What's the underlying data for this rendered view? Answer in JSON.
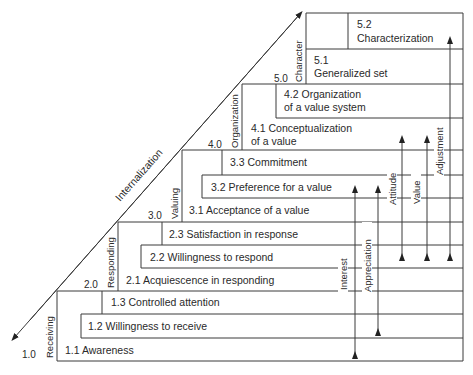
{
  "diagram": {
    "axis_label": "Internalization",
    "colors": {
      "line": "#3a3a3a",
      "text": "#2a2a2a",
      "background": "#ffffff"
    },
    "levels": [
      {
        "number": "1.0",
        "name": "Receiving",
        "items": [
          "1.1 Awareness",
          "1.2 Willingness to receive",
          "1.3 Controlled attention"
        ]
      },
      {
        "number": "2.0",
        "name": "Responding",
        "items": [
          "2.1 Acquiescence in responding",
          "2.2 Willingness to respond",
          "2.3 Satisfaction in response"
        ]
      },
      {
        "number": "3.0",
        "name": "Valuing",
        "items": [
          "3.1 Acceptance of a value",
          "3.2 Preference for a value",
          "3.3 Commitment"
        ]
      },
      {
        "number": "4.0",
        "name": "Organization",
        "items": [
          {
            "line1": "4.1 Conceptualization",
            "line2": "of a value"
          },
          {
            "line1": "4.2 Organization",
            "line2": "of a value system"
          }
        ]
      },
      {
        "number": "5.0",
        "name": "Character",
        "items": [
          {
            "line1": "5.1",
            "line2": "Generalized set"
          },
          {
            "line1": "5.2",
            "line2": "Characterization"
          }
        ]
      }
    ],
    "ranges": [
      {
        "label": "Interest",
        "from": "1.1",
        "to": "3.2"
      },
      {
        "label": "Appreciation",
        "from": "1.2",
        "to": "3.2"
      },
      {
        "label": "Attitude",
        "from": "2.2",
        "to": "4.1"
      },
      {
        "label": "Value",
        "from": "2.2",
        "to": "4.1"
      },
      {
        "label": "Adjustment",
        "from": "2.2",
        "to": "5.2"
      }
    ]
  }
}
